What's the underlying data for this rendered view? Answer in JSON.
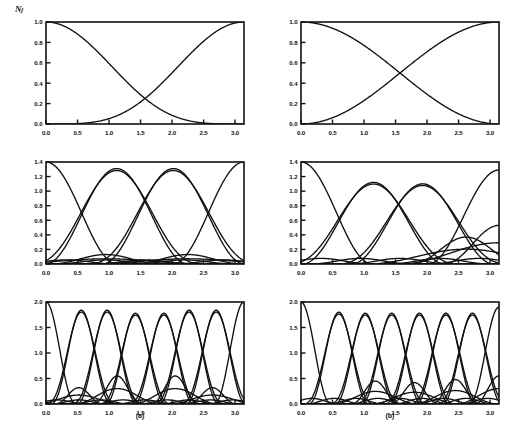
{
  "figure": {
    "ylabel": "Nⱼ",
    "subcaptions": [
      {
        "key": "a",
        "label": "(a)"
      },
      {
        "key": "b",
        "label": "(b)"
      }
    ],
    "axis_color": "#111111",
    "background": "#ffffff"
  },
  "chart_data": [
    {
      "id": "panel-a-row1",
      "type": "line",
      "title": "",
      "xlabel": "",
      "ylabel": "Nⱼ",
      "xlim": [
        0.0,
        3.1416
      ],
      "ylim": [
        0.0,
        1.0
      ],
      "xticks": [
        0.0,
        0.5,
        1.0,
        1.5,
        2.0,
        2.5,
        3.0
      ],
      "xticklabels": [
        "0.0",
        "0.5",
        "1.0",
        "1.5",
        "2.0",
        "2.5",
        "3.0"
      ],
      "yticks": [
        0.0,
        0.2,
        0.4,
        0.6,
        0.8,
        1.0
      ],
      "yticklabels": [
        "0.0",
        "0.2",
        "0.4",
        "0.6",
        "0.8",
        "1.0"
      ],
      "grid": false,
      "legend": "none",
      "n_curves": 2,
      "description": "Two sigmoidal basis functions crossing near x=1.57 at y=0.70",
      "series": [
        {
          "name": "N1",
          "formula": "cos^4(x/2)",
          "crossing_x": 1.5708,
          "crossing_y": 0.7,
          "values": [
            1.0,
            1.0,
            0.995,
            0.985,
            0.965,
            0.93,
            0.88,
            0.81,
            0.73,
            0.63,
            0.53,
            0.42,
            0.32,
            0.23,
            0.15,
            0.09,
            0.045,
            0.018,
            0.005,
            0.0
          ]
        },
        {
          "name": "N2",
          "formula": "sin^4(x/2)",
          "crossing_x": 1.5708,
          "crossing_y": 0.7,
          "values": [
            0.0,
            0.005,
            0.018,
            0.045,
            0.09,
            0.15,
            0.23,
            0.32,
            0.42,
            0.53,
            0.63,
            0.73,
            0.81,
            0.88,
            0.93,
            0.965,
            0.985,
            0.995,
            1.0,
            1.0
          ]
        }
      ]
    },
    {
      "id": "panel-b-row1",
      "type": "line",
      "title": "",
      "xlabel": "",
      "ylabel": "",
      "xlim": [
        0.0,
        3.1416
      ],
      "ylim": [
        0.0,
        1.0
      ],
      "xticks": [
        0.0,
        0.5,
        1.0,
        1.5,
        2.0,
        2.5,
        3.0
      ],
      "xticklabels": [
        "0.0",
        "0.5",
        "1.0",
        "1.5",
        "2.0",
        "2.5",
        "3.0"
      ],
      "yticks": [
        0.0,
        0.2,
        0.4,
        0.6,
        0.8,
        1.0
      ],
      "yticklabels": [
        "0.0",
        "0.2",
        "0.4",
        "0.6",
        "0.8",
        "1.0"
      ],
      "grid": false,
      "legend": "none",
      "n_curves": 2,
      "description": "Two monotone basis functions crossing near x=1.57 at y=0.70; endpoints reach 0 and 1 steeply",
      "series": [
        {
          "name": "N1",
          "formula": "cos^2(x/2)",
          "crossing_x": 1.5708,
          "crossing_y": 0.7,
          "values": [
            1.0,
            0.993,
            0.976,
            0.946,
            0.905,
            0.854,
            0.794,
            0.727,
            0.655,
            0.578,
            0.5,
            0.422,
            0.345,
            0.273,
            0.206,
            0.146,
            0.095,
            0.054,
            0.024,
            0.0
          ]
        },
        {
          "name": "N2",
          "formula": "sin^2(x/2)",
          "crossing_x": 1.5708,
          "crossing_y": 0.7,
          "values": [
            0.0,
            0.024,
            0.054,
            0.095,
            0.146,
            0.206,
            0.273,
            0.345,
            0.422,
            0.5,
            0.578,
            0.655,
            0.727,
            0.794,
            0.854,
            0.905,
            0.946,
            0.976,
            0.993,
            1.0
          ]
        }
      ]
    },
    {
      "id": "panel-a-row2",
      "type": "line",
      "title": "",
      "xlabel": "",
      "ylabel": "",
      "xlim": [
        0.0,
        3.1416
      ],
      "ylim": [
        0.0,
        1.4
      ],
      "xticks": [
        0.0,
        0.5,
        1.0,
        1.5,
        2.0,
        2.5,
        3.0
      ],
      "xticklabels": [
        "0.0",
        "0.5",
        "1.0",
        "1.5",
        "2.0",
        "2.5",
        "3.0"
      ],
      "yticks": [
        0.0,
        0.2,
        0.4,
        0.6,
        0.8,
        1.0,
        1.2,
        1.4
      ],
      "yticklabels": [
        "0.0",
        "0.2",
        "0.4",
        "0.6",
        "0.8",
        "1.0",
        "1.2",
        "1.4"
      ],
      "grid": false,
      "legend": "none",
      "n_curves": 6,
      "description": "Four large bell-shaped lobes peaking at 1.40/1.31 plus two small lobes peaking near 0.13",
      "peaks": [
        {
          "name": "L1",
          "peak_x": 0.0,
          "peak_y": 1.4
        },
        {
          "name": "L2",
          "peak_x": 1.12,
          "peak_y": 1.31
        },
        {
          "name": "L3",
          "peak_x": 2.02,
          "peak_y": 1.31
        },
        {
          "name": "L4",
          "peak_x": 3.14,
          "peak_y": 1.4
        },
        {
          "name": "S1",
          "peak_x": 0.95,
          "peak_y": 0.13
        },
        {
          "name": "S2",
          "peak_x": 2.25,
          "peak_y": 0.13
        }
      ]
    },
    {
      "id": "panel-b-row2",
      "type": "line",
      "title": "",
      "xlabel": "",
      "ylabel": "",
      "xlim": [
        0.0,
        3.1416
      ],
      "ylim": [
        0.0,
        1.4
      ],
      "xticks": [
        0.0,
        0.5,
        1.0,
        1.5,
        2.0,
        2.5,
        3.0
      ],
      "xticklabels": [
        "0.0",
        "0.5",
        "1.0",
        "1.5",
        "2.0",
        "2.5",
        "3.0"
      ],
      "yticks": [
        0.0,
        0.2,
        0.4,
        0.6,
        0.8,
        1.0,
        1.2,
        1.4
      ],
      "yticklabels": [
        "0.0",
        "0.2",
        "0.4",
        "0.6",
        "0.8",
        "1.0",
        "1.2",
        "1.4"
      ],
      "grid": false,
      "legend": "none",
      "n_curves": 6,
      "description": "Broad asymmetric lobes; decaying curve from 1.40 at x=0, lobes peaking 1.12 and 1.10, rising lobe to 1.29 at x=3.14, small lobe near 0.37 and 0.53",
      "peaks": [
        {
          "name": "L1",
          "peak_x": 0.0,
          "peak_y": 1.4
        },
        {
          "name": "L2",
          "peak_x": 1.15,
          "peak_y": 1.12
        },
        {
          "name": "L3",
          "peak_x": 1.93,
          "peak_y": 1.1
        },
        {
          "name": "L4",
          "peak_x": 3.14,
          "peak_y": 1.29
        },
        {
          "name": "S1",
          "peak_x": 2.62,
          "peak_y": 0.37
        },
        {
          "name": "S2",
          "peak_x": 3.14,
          "peak_y": 0.53
        }
      ]
    },
    {
      "id": "panel-a-row3",
      "type": "line",
      "title": "",
      "xlabel": "",
      "ylabel": "",
      "xlim": [
        0.0,
        3.1416
      ],
      "ylim": [
        0.0,
        2.0
      ],
      "xticks": [
        0.0,
        0.5,
        1.0,
        1.5,
        2.0,
        2.5,
        3.0
      ],
      "xticklabels": [
        "0.0",
        "0.5",
        "1.0",
        "1.5",
        "2.0",
        "2.5",
        "3.0"
      ],
      "yticks": [
        0.0,
        0.5,
        1.0,
        1.5,
        2.0
      ],
      "yticklabels": [
        "0.0",
        "0.5",
        "1.0",
        "1.5",
        "2.0"
      ],
      "grid": false,
      "legend": "none",
      "n_curves": 16,
      "description": "Eight tall lobes peaking near 1.85-2.00 across the interval plus many small lobes below 0.55",
      "peaks": [
        {
          "name": "L1",
          "peak_x": 0.0,
          "peak_y": 2.0
        },
        {
          "name": "L2",
          "peak_x": 0.56,
          "peak_y": 1.84
        },
        {
          "name": "L3",
          "peak_x": 0.97,
          "peak_y": 1.84
        },
        {
          "name": "L4",
          "peak_x": 1.42,
          "peak_y": 1.78
        },
        {
          "name": "L5",
          "peak_x": 1.87,
          "peak_y": 1.78
        },
        {
          "name": "L6",
          "peak_x": 2.27,
          "peak_y": 1.84
        },
        {
          "name": "L7",
          "peak_x": 2.7,
          "peak_y": 1.84
        },
        {
          "name": "L8",
          "peak_x": 3.14,
          "peak_y": 2.0
        },
        {
          "name": "S1",
          "peak_x": 0.52,
          "peak_y": 0.32
        },
        {
          "name": "S2",
          "peak_x": 1.13,
          "peak_y": 0.55
        },
        {
          "name": "S3",
          "peak_x": 2.05,
          "peak_y": 0.55
        },
        {
          "name": "S4",
          "peak_x": 2.64,
          "peak_y": 0.32
        }
      ]
    },
    {
      "id": "panel-b-row3",
      "type": "line",
      "title": "",
      "xlabel": "",
      "ylabel": "",
      "xlim": [
        0.0,
        3.1416
      ],
      "ylim": [
        0.0,
        2.0
      ],
      "xticks": [
        0.0,
        0.5,
        1.0,
        1.5,
        2.0,
        2.5,
        3.0
      ],
      "xticklabels": [
        "0.0",
        "0.5",
        "1.0",
        "1.5",
        "2.0",
        "2.5",
        "3.0"
      ],
      "yticks": [
        0.0,
        0.5,
        1.0,
        1.5,
        2.0
      ],
      "yticklabels": [
        "0.0",
        "0.5",
        "1.0",
        "1.5",
        "2.0"
      ],
      "grid": false,
      "legend": "none",
      "n_curves": 16,
      "description": "Decaying curve from 2.00 at x=0, seven lobes peaking about 1.78-1.82, rising curve to 1.90 at x=3.14, plus small lobes up to 0.55",
      "peaks": [
        {
          "name": "L1",
          "peak_x": 0.0,
          "peak_y": 2.0
        },
        {
          "name": "L2",
          "peak_x": 0.6,
          "peak_y": 1.8
        },
        {
          "name": "L3",
          "peak_x": 1.02,
          "peak_y": 1.78
        },
        {
          "name": "L4",
          "peak_x": 1.44,
          "peak_y": 1.78
        },
        {
          "name": "L5",
          "peak_x": 1.88,
          "peak_y": 1.78
        },
        {
          "name": "L6",
          "peak_x": 2.3,
          "peak_y": 1.78
        },
        {
          "name": "L7",
          "peak_x": 2.72,
          "peak_y": 1.78
        },
        {
          "name": "L8",
          "peak_x": 3.14,
          "peak_y": 1.9
        },
        {
          "name": "S1",
          "peak_x": 1.18,
          "peak_y": 0.45
        },
        {
          "name": "S2",
          "peak_x": 1.8,
          "peak_y": 0.42
        },
        {
          "name": "S3",
          "peak_x": 2.45,
          "peak_y": 0.48
        },
        {
          "name": "S4",
          "peak_x": 3.14,
          "peak_y": 0.55
        }
      ]
    }
  ]
}
